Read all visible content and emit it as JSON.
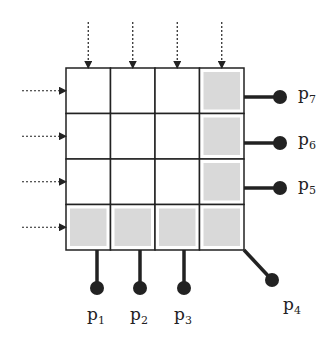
{
  "diagram": {
    "type": "grid-with-ports",
    "grid": {
      "rows": 4,
      "cols": 4,
      "left": 66,
      "top": 68,
      "cell_w": 44.5,
      "cell_h": 45.5
    },
    "shaded_cells": [
      [
        0,
        3
      ],
      [
        1,
        3
      ],
      [
        2,
        3
      ],
      [
        3,
        0
      ],
      [
        3,
        1
      ],
      [
        3,
        2
      ],
      [
        3,
        3
      ]
    ],
    "colors": {
      "line": "#222222",
      "shade": "#d9d9d9",
      "text": "#222222"
    },
    "inputs": {
      "top_arrows": 4,
      "left_arrows": 4,
      "style": "dotted"
    },
    "ports": [
      {
        "id": "p1",
        "base": "p",
        "sub": "1",
        "dot": [
          97,
          288
        ],
        "label_pos": [
          87,
          306
        ]
      },
      {
        "id": "p2",
        "base": "p",
        "sub": "2",
        "dot": [
          140,
          288
        ],
        "label_pos": [
          130,
          306
        ]
      },
      {
        "id": "p3",
        "base": "p",
        "sub": "3",
        "dot": [
          184,
          288
        ],
        "label_pos": [
          174,
          306
        ]
      },
      {
        "id": "p4",
        "base": "p",
        "sub": "4",
        "dot": [
          272,
          280
        ],
        "label_pos": [
          283,
          296
        ]
      },
      {
        "id": "p5",
        "base": "p",
        "sub": "5",
        "dot": [
          280,
          188
        ],
        "label_pos": [
          298,
          176
        ]
      },
      {
        "id": "p6",
        "base": "p",
        "sub": "6",
        "dot": [
          280,
          143
        ],
        "label_pos": [
          298,
          131
        ]
      },
      {
        "id": "p7",
        "base": "p",
        "sub": "7",
        "dot": [
          280,
          97
        ],
        "label_pos": [
          298,
          85
        ]
      }
    ]
  }
}
